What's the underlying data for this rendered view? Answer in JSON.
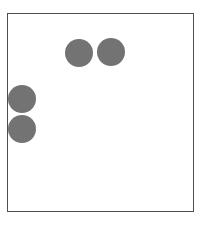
{
  "canvas": {
    "title": "Dot Canvas",
    "background_color": "#ffffff",
    "border_color": "#4f4f4f",
    "border_width_px": 1.5,
    "frame": {
      "x": 7,
      "y": 13,
      "width": 187,
      "height": 199
    }
  },
  "chart_data": {
    "type": "scatter",
    "title": "",
    "xlabel": "",
    "ylabel": "",
    "grid": false,
    "legend": false,
    "axis_visible": false,
    "tick_labels_x": [],
    "tick_labels_y": [],
    "xlim": [
      0,
      187
    ],
    "ylim": [
      0,
      199
    ],
    "marker_shape": "circle",
    "marker_color": "#737373",
    "marker_diameter_px": 28,
    "point_count": 4,
    "points": [
      {
        "id": "dot-1",
        "label": "",
        "x": 57,
        "y": 25,
        "diameter": 28,
        "color": "#737373"
      },
      {
        "id": "dot-2",
        "label": "",
        "x": 89,
        "y": 24,
        "diameter": 28,
        "color": "#737373"
      },
      {
        "id": "dot-3",
        "label": "",
        "x": 0,
        "y": 71,
        "diameter": 28,
        "color": "#737373"
      },
      {
        "id": "dot-4",
        "label": "",
        "x": 0,
        "y": 101,
        "diameter": 28,
        "color": "#737373"
      }
    ]
  }
}
